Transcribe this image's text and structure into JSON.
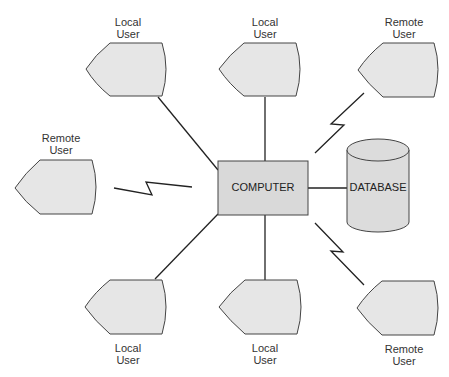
{
  "diagram": {
    "center": {
      "label": "COMPUTER"
    },
    "database": {
      "label": "DATABASE"
    },
    "terminals": [
      {
        "id": "top-left",
        "line1": "Local",
        "line2": "User",
        "connection": "wired"
      },
      {
        "id": "top-center",
        "line1": "Local",
        "line2": "User",
        "connection": "wired"
      },
      {
        "id": "top-right",
        "line1": "Remote",
        "line2": "User",
        "connection": "wireless"
      },
      {
        "id": "mid-left",
        "line1": "Remote",
        "line2": "User",
        "connection": "wireless"
      },
      {
        "id": "bottom-left",
        "line1": "Local",
        "line2": "User",
        "connection": "wired"
      },
      {
        "id": "bottom-center",
        "line1": "Local",
        "line2": "User",
        "connection": "wired"
      },
      {
        "id": "bottom-right",
        "line1": "Remote",
        "line2": "User",
        "connection": "wireless"
      }
    ],
    "colors": {
      "fill": "#e6e6e6",
      "stroke": "#333333",
      "line": "#222222"
    }
  }
}
